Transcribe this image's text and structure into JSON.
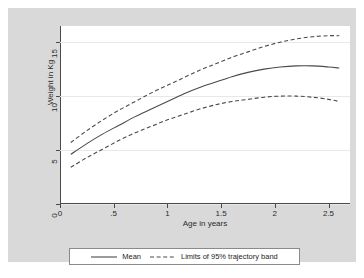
{
  "chart_data": {
    "type": "line",
    "title": "",
    "xlabel": "Age in years",
    "ylabel": "Weight in Kg",
    "xlim": [
      0,
      2.7
    ],
    "ylim": [
      0,
      16.5
    ],
    "xticks": [
      "0",
      ".5",
      "1",
      "1.5",
      "2",
      "2.5"
    ],
    "xtick_values": [
      0,
      0.5,
      1,
      1.5,
      2,
      2.5
    ],
    "yticks": [
      "0",
      "5",
      "10",
      "15"
    ],
    "ytick_values": [
      0,
      5,
      10,
      15
    ],
    "grid": "horizontal",
    "legend_position": "below",
    "x": [
      0.1,
      0.25,
      0.4,
      0.55,
      0.7,
      0.85,
      1.0,
      1.15,
      1.3,
      1.45,
      1.6,
      1.75,
      1.9,
      2.05,
      2.2,
      2.35,
      2.5,
      2.6
    ],
    "series": [
      {
        "name": "Mean",
        "style": "solid",
        "color": "#4a4a4a",
        "values": [
          4.6,
          5.6,
          6.5,
          7.3,
          8.1,
          8.8,
          9.5,
          10.2,
          10.8,
          11.3,
          11.8,
          12.2,
          12.5,
          12.7,
          12.8,
          12.8,
          12.7,
          12.6
        ]
      },
      {
        "name": "Upper limit of 95% trajectory band",
        "style": "dashed",
        "color": "#4a4a4a",
        "values": [
          5.7,
          6.8,
          7.8,
          8.7,
          9.5,
          10.3,
          11.0,
          11.7,
          12.4,
          13.0,
          13.6,
          14.1,
          14.6,
          15.0,
          15.3,
          15.5,
          15.6,
          15.6
        ]
      },
      {
        "name": "Lower limit of 95% trajectory band",
        "style": "dashed",
        "color": "#4a4a4a",
        "values": [
          3.4,
          4.3,
          5.1,
          5.9,
          6.6,
          7.2,
          7.8,
          8.3,
          8.8,
          9.2,
          9.5,
          9.7,
          9.9,
          10.0,
          10.0,
          9.9,
          9.7,
          9.5
        ]
      }
    ],
    "legend": [
      {
        "label": "Mean",
        "style": "solid"
      },
      {
        "label": "Limits of 95% trajectory band",
        "style": "dashed"
      }
    ]
  },
  "colors": {
    "graph_background": "#d9d9d9",
    "plot_background": "#ffffff",
    "line": "#4a4a4a",
    "grid": "#e8e8e8",
    "axis": "#4a4a4a"
  }
}
